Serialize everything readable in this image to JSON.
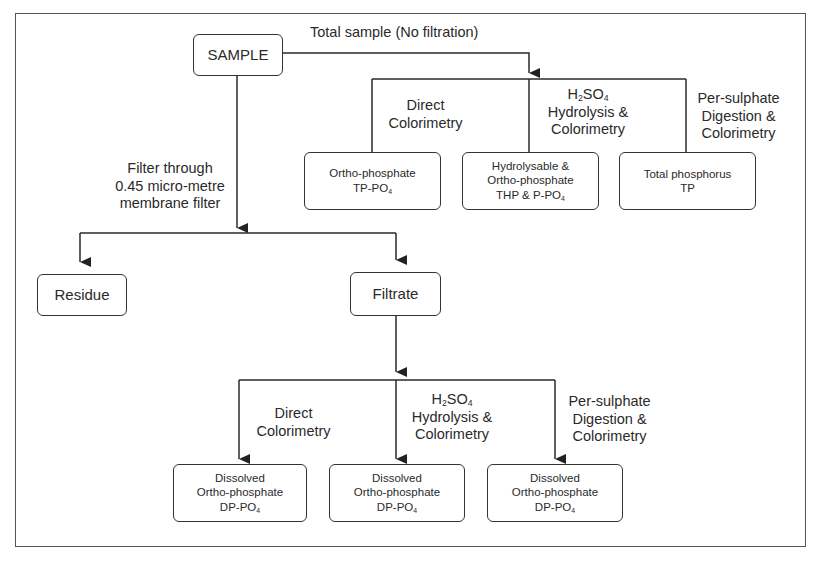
{
  "diagram": {
    "type": "flowchart"
  },
  "nodes": {
    "sample": "SAMPLE",
    "residue": "Residue",
    "filtrate": "Filtrate",
    "ortho_total": {
      "line1": "Ortho-phosphate",
      "line2": "TP-PO",
      "sub": "4"
    },
    "hydrolysable_total": {
      "line1": "Hydrolysable &",
      "line2": "Ortho-phosphate",
      "line3": "THP & P-PO",
      "sub": "4"
    },
    "total_p": {
      "line1": "Total phosphorus",
      "line2": "TP"
    },
    "dissolved_1": {
      "line1": "Dissolved",
      "line2": "Ortho-phosphate",
      "line3": "DP-PO",
      "sub": "4"
    },
    "dissolved_2": {
      "line1": "Dissolved",
      "line2": "Ortho-phosphate",
      "line3": "DP-PO",
      "sub": "4"
    },
    "dissolved_3": {
      "line1": "Dissolved",
      "line2": "Ortho-phosphate",
      "line3": "DP-PO",
      "sub": "4"
    }
  },
  "edges": {
    "total_sample": "Total sample (No filtration)",
    "filter": {
      "line1": "Filter through",
      "line2": "0.45 micro-metre",
      "line3": "membrane filter"
    },
    "direct": {
      "line1": "Direct",
      "line2": "Colorimetry"
    },
    "h2so4": {
      "h": "H",
      "h_sub": "2",
      "so": "SO",
      "so_sub": "4",
      "line2": "Hydrolysis &",
      "line3": "Colorimetry"
    },
    "persulphate": {
      "line1": "Per-sulphate",
      "line2": "Digestion &",
      "line3": "Colorimetry"
    }
  }
}
